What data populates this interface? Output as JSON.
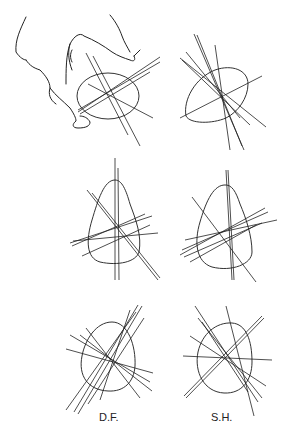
{
  "figure": {
    "panels": [
      {
        "id": "top-left",
        "shape": "oval held between thumb and fingers",
        "hand": true,
        "line_count": 6
      },
      {
        "id": "top-right",
        "shape": "rounded triangle",
        "line_count": 7
      },
      {
        "id": "middle-left",
        "shape": "egg, pointed top",
        "line_count": 8
      },
      {
        "id": "middle-right",
        "shape": "egg, pointed top",
        "line_count": 8
      },
      {
        "id": "bottom-left",
        "shape": "egg",
        "line_count": 9
      },
      {
        "id": "bottom-right",
        "shape": "egg",
        "line_count": 8
      }
    ],
    "labels": {
      "left": "D.F.",
      "right": "S.H."
    }
  }
}
